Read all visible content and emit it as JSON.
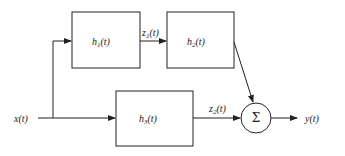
{
  "diagram": {
    "type": "block-diagram",
    "input": "x(t)",
    "output": "y(t)",
    "blocks": [
      {
        "id": "h1",
        "label": "h",
        "sub": "1",
        "arg": "(t)"
      },
      {
        "id": "h2",
        "label": "h",
        "sub": "2",
        "arg": "(t)"
      },
      {
        "id": "h3",
        "label": "h",
        "sub": "3",
        "arg": "(t)"
      }
    ],
    "signals": [
      {
        "id": "z1",
        "label": "z",
        "sub": "1",
        "arg": "(t)"
      },
      {
        "id": "z2",
        "label": "z",
        "sub": "2",
        "arg": "(t)"
      }
    ],
    "summer": {
      "symbol": "Σ"
    },
    "connections": [
      "x(t) -> h1",
      "x(t) -> h3",
      "h1 -> h2 (z1(t))",
      "h2 -> Σ",
      "h3 -> Σ (z2(t))",
      "Σ -> y(t)"
    ]
  }
}
